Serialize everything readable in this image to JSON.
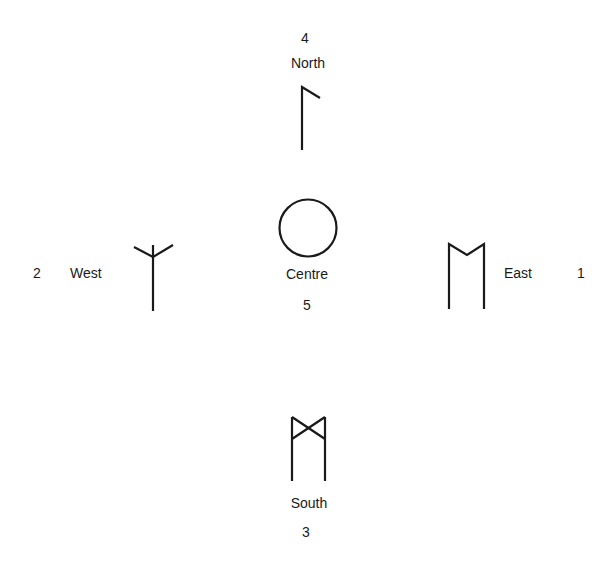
{
  "diagram": {
    "type": "rune-directions",
    "stroke_color": "#1a1a1a",
    "background_color": "#ffffff",
    "positions": {
      "north": {
        "number": "4",
        "label": "North",
        "rune": "kaun-like (vertical stave with short diagonal branch at top-right)"
      },
      "west": {
        "number": "2",
        "label": "West",
        "rune": "algiz-inverted-like (vertical stave with two upward arms at top)"
      },
      "centre": {
        "number": "5",
        "label": "Centre",
        "rune": "circle"
      },
      "east": {
        "number": "1",
        "label": "East",
        "rune": "ehwaz-like (two vertical staves joined by a V at the top)"
      },
      "south": {
        "number": "3",
        "label": "South",
        "rune": "dagaz-over-staves (two vertical staves with crossed diagonals at top)"
      }
    }
  }
}
